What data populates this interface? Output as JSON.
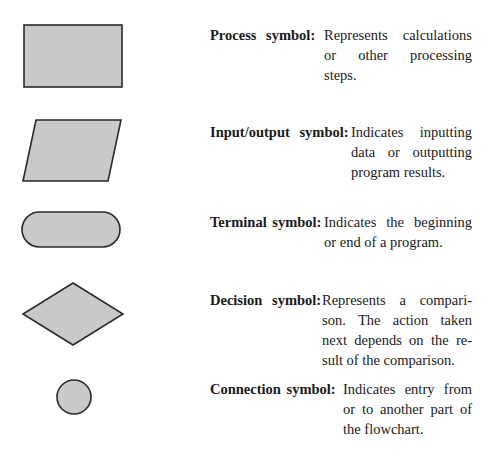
{
  "colors": {
    "shape_fill": "#c9c9c9",
    "shape_stroke": "#2a2a2a",
    "text": "#1a1a1a"
  },
  "symbols": [
    {
      "id": "process",
      "shape": "rectangle",
      "label": "Process symbol:",
      "description_lines": [
        "Represents calculations",
        "or other processing",
        "steps."
      ]
    },
    {
      "id": "io",
      "shape": "parallelogram",
      "label": "Input/output symbol:",
      "description_lines": [
        "Indicates inputting",
        "data or outputting",
        "program results."
      ]
    },
    {
      "id": "terminal",
      "shape": "rounded-rectangle",
      "label": "Terminal symbol:",
      "description_lines": [
        "Indicates the beginning",
        "or end of a program."
      ]
    },
    {
      "id": "decision",
      "shape": "diamond",
      "label": "Decision symbol:",
      "description_lines": [
        "Represents a compari-",
        "son. The action taken",
        "next depends on the re-",
        "sult of the comparison."
      ]
    },
    {
      "id": "connection",
      "shape": "circle",
      "label": "Connection symbol:",
      "description_lines": [
        "Indicates entry from",
        "or to another part of",
        "the flowchart."
      ]
    }
  ]
}
